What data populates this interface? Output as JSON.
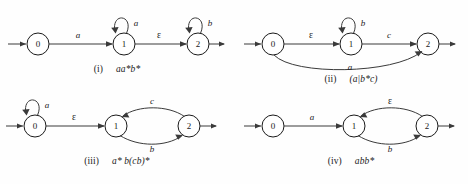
{
  "figure": {
    "ink_color": "#3a3a3a",
    "node_fill": "#ffffff",
    "background": "#fefefe"
  },
  "diagrams": [
    {
      "id": "i",
      "caption_number": "(i)",
      "caption_expression": "aa*b*",
      "states": [
        {
          "label": "0",
          "name": "state-0"
        },
        {
          "label": "1",
          "name": "state-1"
        },
        {
          "label": "2",
          "name": "state-2"
        }
      ],
      "edges": [
        {
          "from": "start",
          "to": "0",
          "label": "",
          "kind": "start-arrow"
        },
        {
          "from": "0",
          "to": "1",
          "label": "a",
          "kind": "straight"
        },
        {
          "from": "1",
          "to": "1",
          "label": "a",
          "kind": "self-loop"
        },
        {
          "from": "1",
          "to": "2",
          "label": "ε",
          "kind": "straight"
        },
        {
          "from": "2",
          "to": "2",
          "label": "b",
          "kind": "self-loop"
        },
        {
          "from": "2",
          "to": "end",
          "label": "",
          "kind": "exit-arrow"
        }
      ]
    },
    {
      "id": "ii",
      "caption_number": "(ii)",
      "caption_expression": "(a|b*c)",
      "states": [
        {
          "label": "0",
          "name": "state-0"
        },
        {
          "label": "1",
          "name": "state-1"
        },
        {
          "label": "2",
          "name": "state-2"
        }
      ],
      "edges": [
        {
          "from": "start",
          "to": "0",
          "label": "",
          "kind": "start-arrow"
        },
        {
          "from": "0",
          "to": "1",
          "label": "ε",
          "kind": "straight"
        },
        {
          "from": "1",
          "to": "1",
          "label": "b",
          "kind": "self-loop"
        },
        {
          "from": "1",
          "to": "2",
          "label": "c",
          "kind": "straight"
        },
        {
          "from": "0",
          "to": "2",
          "label": "a",
          "kind": "lower-arc"
        },
        {
          "from": "2",
          "to": "end",
          "label": "",
          "kind": "exit-arrow"
        }
      ]
    },
    {
      "id": "iii",
      "caption_number": "(iii)",
      "caption_expression": "a* b(cb)*",
      "states": [
        {
          "label": "0",
          "name": "state-0"
        },
        {
          "label": "1",
          "name": "state-1"
        },
        {
          "label": "2",
          "name": "state-2"
        }
      ],
      "edges": [
        {
          "from": "start",
          "to": "0",
          "label": "",
          "kind": "start-arrow"
        },
        {
          "from": "0",
          "to": "0",
          "label": "a",
          "kind": "self-loop"
        },
        {
          "from": "0",
          "to": "1",
          "label": "ε",
          "kind": "straight"
        },
        {
          "from": "1",
          "to": "2",
          "label": "b",
          "kind": "lower-arc"
        },
        {
          "from": "2",
          "to": "1",
          "label": "c",
          "kind": "upper-arc"
        },
        {
          "from": "2",
          "to": "end",
          "label": "",
          "kind": "exit-arrow"
        }
      ]
    },
    {
      "id": "iv",
      "caption_number": "(iv)",
      "caption_expression": "abb*",
      "states": [
        {
          "label": "0",
          "name": "state-0"
        },
        {
          "label": "1",
          "name": "state-1"
        },
        {
          "label": "2",
          "name": "state-2"
        }
      ],
      "edges": [
        {
          "from": "start",
          "to": "0",
          "label": "",
          "kind": "start-arrow"
        },
        {
          "from": "0",
          "to": "1",
          "label": "a",
          "kind": "straight"
        },
        {
          "from": "1",
          "to": "2",
          "label": "b",
          "kind": "lower-arc"
        },
        {
          "from": "2",
          "to": "1",
          "label": "ε",
          "kind": "upper-arc"
        },
        {
          "from": "2",
          "to": "end",
          "label": "",
          "kind": "exit-arrow"
        }
      ]
    }
  ]
}
